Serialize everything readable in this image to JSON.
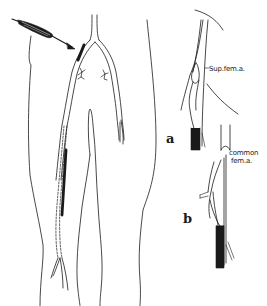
{
  "figure": {
    "labels": {
      "sup_fem_a": "Sup.fem.a.",
      "common_fem_a_line1": "common",
      "common_fem_a_line2": "fem.a.",
      "panel_a": "a",
      "panel_b": "b"
    },
    "elements": {
      "main_view": "bilateral lower-limb outline with femoral arteries",
      "inset_a": "detail of superficial femoral artery catheterization",
      "inset_b": "detail of common femoral artery catheterization",
      "instrument": "catheter/needle with arrow pointing to left groin"
    },
    "colors": {
      "ink": "#1a1a1a",
      "background": "#ffffff"
    }
  }
}
